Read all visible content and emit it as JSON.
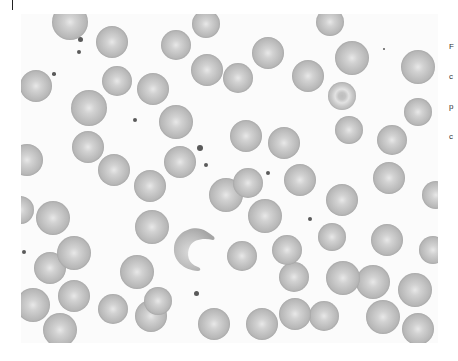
{
  "figure": {
    "cells": [
      {
        "x": 70,
        "y": 22,
        "r": 18
      },
      {
        "x": 112,
        "y": 42,
        "r": 16
      },
      {
        "x": 176,
        "y": 45,
        "r": 15
      },
      {
        "x": 206,
        "y": 24,
        "r": 14
      },
      {
        "x": 207,
        "y": 70,
        "r": 16
      },
      {
        "x": 238,
        "y": 78,
        "r": 15
      },
      {
        "x": 268,
        "y": 53,
        "r": 16
      },
      {
        "x": 308,
        "y": 76,
        "r": 16
      },
      {
        "x": 330,
        "y": 22,
        "r": 14
      },
      {
        "x": 352,
        "y": 58,
        "r": 17
      },
      {
        "x": 418,
        "y": 67,
        "r": 17
      },
      {
        "x": 36,
        "y": 86,
        "r": 16
      },
      {
        "x": 117,
        "y": 81,
        "r": 15
      },
      {
        "x": 153,
        "y": 89,
        "r": 16
      },
      {
        "x": 89,
        "y": 108,
        "r": 18
      },
      {
        "x": 176,
        "y": 122,
        "r": 17
      },
      {
        "x": 342,
        "y": 96,
        "r": 14,
        "type": "target"
      },
      {
        "x": 349,
        "y": 130,
        "r": 14
      },
      {
        "x": 392,
        "y": 140,
        "r": 15
      },
      {
        "x": 418,
        "y": 112,
        "r": 14
      },
      {
        "x": 27,
        "y": 160,
        "r": 16
      },
      {
        "x": 88,
        "y": 147,
        "r": 16
      },
      {
        "x": 114,
        "y": 170,
        "r": 16
      },
      {
        "x": 150,
        "y": 186,
        "r": 16
      },
      {
        "x": 180,
        "y": 162,
        "r": 16
      },
      {
        "x": 246,
        "y": 136,
        "r": 16
      },
      {
        "x": 284,
        "y": 143,
        "r": 16
      },
      {
        "x": 248,
        "y": 183,
        "r": 15
      },
      {
        "x": 300,
        "y": 180,
        "r": 16
      },
      {
        "x": 226,
        "y": 195,
        "r": 17
      },
      {
        "x": 342,
        "y": 200,
        "r": 16
      },
      {
        "x": 389,
        "y": 178,
        "r": 16
      },
      {
        "x": 436,
        "y": 195,
        "r": 14
      },
      {
        "x": 53,
        "y": 218,
        "r": 17
      },
      {
        "x": 152,
        "y": 227,
        "r": 17
      },
      {
        "x": 265,
        "y": 216,
        "r": 17
      },
      {
        "x": 242,
        "y": 256,
        "r": 15
      },
      {
        "x": 287,
        "y": 250,
        "r": 15
      },
      {
        "x": 332,
        "y": 237,
        "r": 14
      },
      {
        "x": 387,
        "y": 240,
        "r": 16
      },
      {
        "x": 433,
        "y": 250,
        "r": 14
      },
      {
        "x": 74,
        "y": 253,
        "r": 17
      },
      {
        "x": 50,
        "y": 268,
        "r": 16
      },
      {
        "x": 137,
        "y": 272,
        "r": 17
      },
      {
        "x": 74,
        "y": 296,
        "r": 16
      },
      {
        "x": 33,
        "y": 305,
        "r": 17
      },
      {
        "x": 113,
        "y": 309,
        "r": 15
      },
      {
        "x": 158,
        "y": 301,
        "r": 14
      },
      {
        "x": 151,
        "y": 316,
        "r": 16
      },
      {
        "x": 294,
        "y": 277,
        "r": 15
      },
      {
        "x": 295,
        "y": 314,
        "r": 16
      },
      {
        "x": 343,
        "y": 278,
        "r": 17
      },
      {
        "x": 373,
        "y": 282,
        "r": 17
      },
      {
        "x": 415,
        "y": 290,
        "r": 17
      },
      {
        "x": 60,
        "y": 330,
        "r": 17
      },
      {
        "x": 214,
        "y": 324,
        "r": 16
      },
      {
        "x": 262,
        "y": 324,
        "r": 16
      },
      {
        "x": 324,
        "y": 316,
        "r": 15
      },
      {
        "x": 383,
        "y": 317,
        "r": 17
      },
      {
        "x": 418,
        "y": 329,
        "r": 16
      },
      {
        "x": 20,
        "y": 210,
        "r": 14
      }
    ],
    "dots": [
      {
        "x": 80,
        "y": 39,
        "r": 2.5
      },
      {
        "x": 79,
        "y": 52,
        "r": 2.3
      },
      {
        "x": 54,
        "y": 74,
        "r": 1.8
      },
      {
        "x": 135,
        "y": 120,
        "r": 2
      },
      {
        "x": 200,
        "y": 148,
        "r": 3
      },
      {
        "x": 206,
        "y": 165,
        "r": 2.2
      },
      {
        "x": 268,
        "y": 173,
        "r": 2
      },
      {
        "x": 310,
        "y": 219,
        "r": 2
      },
      {
        "x": 196,
        "y": 293,
        "r": 2.5
      },
      {
        "x": 24,
        "y": 252,
        "r": 2
      },
      {
        "x": 384,
        "y": 49,
        "r": 1.2
      }
    ]
  },
  "caption": {
    "lines": [
      "F",
      "c",
      "p",
      "c"
    ]
  },
  "colors": {
    "page_background": "#ffffff",
    "cell_fill": "#bcbcbc",
    "platelet": "#5a5a5a"
  }
}
